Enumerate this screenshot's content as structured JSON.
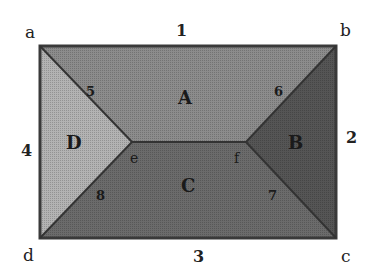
{
  "diagram": {
    "corners": {
      "a": "a",
      "b": "b",
      "c": "c",
      "d": "d"
    },
    "edges": {
      "top": "1",
      "right": "2",
      "bottom": "3",
      "left": "4"
    },
    "faces": {
      "top": "A",
      "right": "B",
      "bottom": "C",
      "left": "D"
    },
    "hips": {
      "ae": "5",
      "bf": "6",
      "cf": "7",
      "de": "8"
    },
    "ridge_points": {
      "e": "e",
      "f": "f"
    },
    "colors": {
      "face_A": "#8c8c8c",
      "face_B": "#555555",
      "face_C": "#6b6b6b",
      "face_D": "#b3b3b3",
      "outline": "#3a3a3a"
    }
  }
}
